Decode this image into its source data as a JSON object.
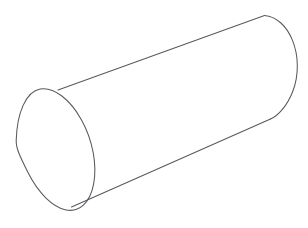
{
  "canvas": {
    "width": 308,
    "height": 228,
    "background_color": "#ffffff",
    "stroke_color": "#555a5e",
    "stroke_width": 1.05,
    "fill_color": "#ffffff"
  },
  "figure": {
    "title": "",
    "style": "wireframe-outline-line-drawing",
    "labels": [],
    "annotations": []
  },
  "geometry": {
    "near_cap": {
      "name": "front-elliptical-face",
      "cx": 56.5,
      "cy": 148.0,
      "rx": 41.0,
      "ry": 62.5,
      "rotation_deg": -4,
      "visible_arc": "full"
    },
    "far_cap": {
      "name": "back-elliptical-face",
      "cx": 267.5,
      "cy": 67.0,
      "rx": 29.5,
      "ry": 52.0,
      "rotation_deg": -4,
      "visible_arc": "right-half"
    },
    "top_silhouette": {
      "name": "top-side-line",
      "x1": 58.0,
      "y1": 90.0,
      "x2": 264.5,
      "y2": 15.5
    },
    "bottom_silhouette": {
      "name": "bottom-side-line",
      "x1": 71.5,
      "y1": 207.0,
      "x2": 270.5,
      "y2": 119.0
    }
  },
  "paths": {
    "near_cap_ellipse": "M 16.2 140.5 C 16.9 113.0 26.0 91.5 40.2 89.0 C 53.5 86.6 70.0 99.0 81.8 120.4 C 93.0 140.8 97.2 165.5 93.6 184.2 C 90.0 203.2 79.0 212.6 66.0 209.9 C 52.6 207.2 38.0 192.7 28.0 172.6 C 19.6 155.9 15.9 147.9 16.2 140.5 Z",
    "far_cap_arc": "M 264.5 15.5 C 276.0 16.4 286.6 25.6 292.6 40.6 C 298.8 56.2 298.9 75.0 292.9 91.0 C 287.4 105.8 277.9 115.9 270.5 119.0",
    "top_line": "M 58.0 90.0 L 264.5 15.5",
    "bottom_line": "M 71.5 207.0 L 270.5 119.0",
    "body_fill": "M 58.0 90.0 L 264.5 15.5 C 276.0 16.4 286.6 25.6 292.6 40.6 C 298.8 56.2 298.9 75.0 292.9 91.0 C 287.4 105.8 277.9 115.9 270.5 119.0 L 71.5 207.0 C 60.0 205.0 46.5 192.0 36.0 174.0 C 24.0 153.5 17.0 130.0 18.5 112.0 C 19.8 97.5 26.0 89.4 40.2 89.0 C 46.5 88.8 52.2 89.2 58.0 90.0 Z"
  }
}
